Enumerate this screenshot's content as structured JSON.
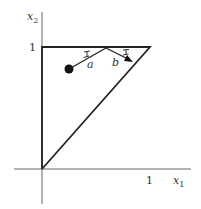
{
  "diagram": {
    "axes": {
      "x_label": "x",
      "x_subscript": "1",
      "y_label": "x",
      "y_subscript": "2",
      "x_tick_label": "1",
      "y_tick_label": "1"
    },
    "vectors": [
      {
        "label": "a"
      },
      {
        "label": "b"
      }
    ],
    "colors": {
      "line": "#222222",
      "axis": "#555555",
      "text": "#333333"
    }
  }
}
